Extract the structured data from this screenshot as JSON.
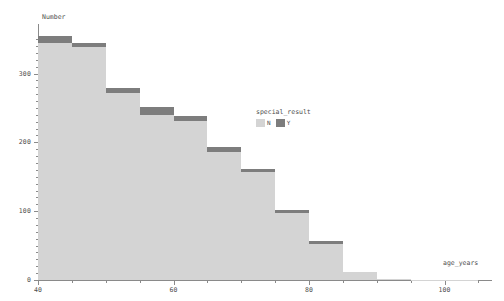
{
  "chart_data": {
    "type": "bar",
    "subtype": "stacked-histogram",
    "title": "",
    "xlabel": "age_years",
    "ylabel": "Number",
    "xlim": [
      40,
      107
    ],
    "ylim": [
      0,
      372
    ],
    "bin_width": 5,
    "grid": false,
    "legend": {
      "title": "special_result",
      "position": "center-right",
      "entries": [
        {
          "name": "N",
          "color": "#d4d4d4"
        },
        {
          "name": "Y",
          "color": "#7d7d7d"
        }
      ]
    },
    "xticks": [
      40,
      60,
      80,
      100
    ],
    "xtick_labels": [
      "40",
      "60",
      "80",
      "100"
    ],
    "xminorticks": [
      45,
      50,
      55,
      65,
      70,
      75,
      85,
      90,
      95,
      105
    ],
    "yticks": [
      0,
      100,
      200,
      300
    ],
    "ytick_labels": [
      "0",
      "100",
      "200",
      "300"
    ],
    "yminorticks": [
      10,
      20,
      30,
      40,
      50,
      60,
      70,
      80,
      90,
      110,
      120,
      130,
      140,
      150,
      160,
      170,
      180,
      190,
      210,
      220,
      230,
      240,
      250,
      260,
      270,
      280,
      290,
      310,
      320,
      330,
      340,
      350
    ],
    "bins": [
      {
        "x0": 40,
        "x1": 45,
        "N": 344,
        "Y": 11,
        "total": 355
      },
      {
        "x0": 45,
        "x1": 50,
        "N": 338,
        "Y": 6,
        "total": 344
      },
      {
        "x0": 50,
        "x1": 55,
        "N": 272,
        "Y": 7,
        "total": 279
      },
      {
        "x0": 55,
        "x1": 60,
        "N": 240,
        "Y": 11,
        "total": 251
      },
      {
        "x0": 60,
        "x1": 65,
        "N": 231,
        "Y": 7,
        "total": 238
      },
      {
        "x0": 65,
        "x1": 70,
        "N": 186,
        "Y": 7,
        "total": 193
      },
      {
        "x0": 70,
        "x1": 75,
        "N": 157,
        "Y": 5,
        "total": 162
      },
      {
        "x0": 75,
        "x1": 80,
        "N": 98,
        "Y": 3,
        "total": 101
      },
      {
        "x0": 80,
        "x1": 85,
        "N": 53,
        "Y": 3,
        "total": 56
      },
      {
        "x0": 85,
        "x1": 90,
        "N": 12,
        "Y": 0,
        "total": 12
      },
      {
        "x0": 90,
        "x1": 95,
        "N": 2,
        "Y": 0,
        "total": 2
      },
      {
        "x0": 95,
        "x1": 100,
        "N": 1,
        "Y": 0,
        "total": 1
      },
      {
        "x0": 100,
        "x1": 105,
        "N": 1,
        "Y": 0,
        "total": 1
      }
    ],
    "series": [
      {
        "name": "N",
        "color": "#d4d4d4",
        "values": [
          344,
          338,
          272,
          240,
          231,
          186,
          157,
          98,
          53,
          12,
          2,
          1,
          1
        ]
      },
      {
        "name": "Y",
        "color": "#7d7d7d",
        "values": [
          11,
          6,
          7,
          11,
          7,
          7,
          5,
          3,
          3,
          0,
          0,
          0,
          0
        ]
      }
    ],
    "categories": [
      "40-45",
      "45-50",
      "50-55",
      "55-60",
      "60-65",
      "65-70",
      "70-75",
      "75-80",
      "80-85",
      "85-90",
      "90-95",
      "95-100",
      "100-105"
    ]
  },
  "colors": {
    "background": "#ffffff",
    "axis": "#8a8a8a",
    "text": "#4d4d4d",
    "series_n": "#d4d4d4",
    "series_y": "#7d7d7d"
  }
}
